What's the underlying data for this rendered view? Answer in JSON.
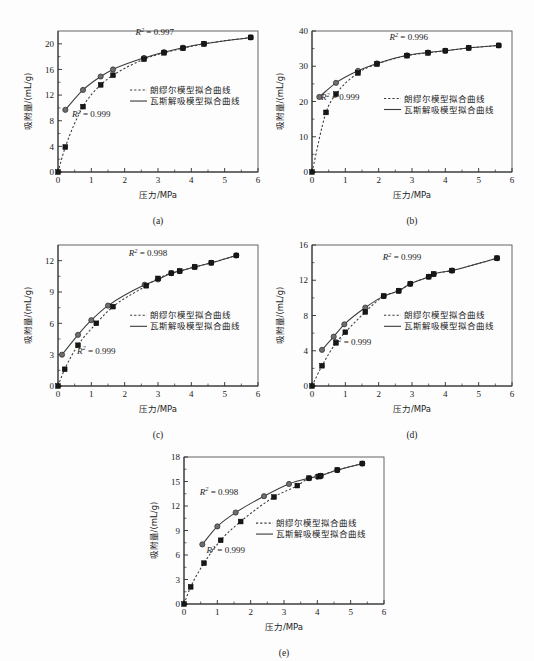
{
  "figure": {
    "background": "#fdfdfd",
    "panel_count": 5,
    "axis_color": "#2b2b2b",
    "curve_color": "#3a3a3a",
    "circle_marker_color": "#6e6e6e",
    "square_marker_color": "#181818"
  },
  "common": {
    "xlabel": "压力/MPa",
    "ylabel": "吸附量/(mL/g)",
    "legend": [
      {
        "label": "朗缪尔模型拟合曲线",
        "style": "dashed"
      },
      {
        "label": "瓦斯解吸模型拟合曲线",
        "style": "solid"
      }
    ],
    "xticks": [
      0,
      1,
      2,
      3,
      4,
      5,
      6
    ],
    "xlim": [
      0,
      6
    ]
  },
  "chart_data": [
    {
      "id": "a",
      "type": "scatter",
      "caption": "(a)",
      "title": "",
      "xlabel": "压力/MPa",
      "ylabel": "吸附量/(mL/g)",
      "xlim": [
        0,
        6
      ],
      "ylim": [
        0,
        22
      ],
      "xticks": [
        0,
        1,
        2,
        3,
        4,
        5,
        6
      ],
      "yticks": [
        0,
        4,
        8,
        12,
        16,
        20
      ],
      "grid": false,
      "legend_position": "center-right",
      "annotations": [
        {
          "text": "R² = 0.997",
          "series": "瓦斯解吸模型拟合曲线",
          "x": 2.9,
          "y": 21.4
        },
        {
          "text": "R² = 0.999",
          "series": "朗缪尔模型拟合曲线",
          "x": 1.0,
          "y": 8.6
        }
      ],
      "series": [
        {
          "name": "瓦斯解吸模型拟合曲线",
          "style": "solid",
          "marker": "circle",
          "x": [
            0.22,
            0.75,
            1.28,
            1.65,
            2.58,
            3.18,
            3.75,
            4.38,
            5.78
          ],
          "y": [
            9.7,
            12.8,
            14.9,
            16.0,
            17.8,
            18.7,
            19.4,
            20.0,
            21.0
          ]
        },
        {
          "name": "朗缪尔模型拟合曲线",
          "style": "dashed",
          "marker": "square",
          "x": [
            0.0,
            0.22,
            0.75,
            1.28,
            1.65,
            2.58,
            3.18,
            3.75,
            4.38,
            5.78
          ],
          "y": [
            0.0,
            3.9,
            10.2,
            13.6,
            15.1,
            17.6,
            18.6,
            19.3,
            20.0,
            21.0
          ]
        }
      ]
    },
    {
      "id": "b",
      "type": "scatter",
      "caption": "(b)",
      "title": "",
      "xlabel": "压力/MPa",
      "ylabel": "吸附量/(mL/g)",
      "xlim": [
        0,
        6
      ],
      "ylim": [
        0,
        40
      ],
      "xticks": [
        0,
        1,
        2,
        3,
        4,
        5,
        6
      ],
      "yticks": [
        0,
        10,
        20,
        30,
        40
      ],
      "grid": false,
      "legend_position": "center-right",
      "annotations": [
        {
          "text": "R² = 0.996",
          "series": "瓦斯解吸模型拟合曲线",
          "x": 2.9,
          "y": 37.4
        },
        {
          "text": "R² = 0.999",
          "series": "朗缪尔模型拟合曲线",
          "x": 0.85,
          "y": 20.5
        }
      ],
      "series": [
        {
          "name": "瓦斯解吸模型拟合曲线",
          "style": "solid",
          "marker": "circle",
          "x": [
            0.22,
            0.72,
            1.38,
            1.95,
            2.85,
            3.48,
            4.0,
            4.7,
            5.6
          ],
          "y": [
            21.3,
            25.3,
            28.7,
            30.8,
            33.1,
            33.9,
            34.4,
            35.2,
            35.9
          ]
        },
        {
          "name": "朗缪尔模型拟合曲线",
          "style": "dashed",
          "marker": "square",
          "x": [
            0.0,
            0.42,
            0.72,
            1.38,
            1.95,
            2.85,
            3.48,
            4.0,
            4.7,
            5.6
          ],
          "y": [
            0.0,
            16.9,
            22.1,
            28.1,
            30.6,
            33.0,
            33.8,
            34.4,
            35.2,
            35.9
          ]
        }
      ]
    },
    {
      "id": "c",
      "type": "scatter",
      "caption": "(c)",
      "title": "",
      "xlabel": "压力/MPa",
      "ylabel": "吸附量/(mL/g)",
      "xlim": [
        0,
        6
      ],
      "ylim": [
        0,
        13.5
      ],
      "xticks": [
        0,
        1,
        2,
        3,
        4,
        5,
        6
      ],
      "yticks": [
        0,
        3,
        6,
        9,
        12
      ],
      "grid": false,
      "legend_position": "center-right",
      "annotations": [
        {
          "text": "R² = 0.998",
          "series": "瓦斯解吸模型拟合曲线",
          "x": 2.7,
          "y": 12.4
        },
        {
          "text": "R² = 0.999",
          "series": "朗缪尔模型拟合曲线",
          "x": 1.15,
          "y": 3.1
        }
      ],
      "series": [
        {
          "name": "瓦斯解吸模型拟合曲线",
          "style": "solid",
          "marker": "circle",
          "x": [
            0.12,
            0.6,
            1.0,
            1.5,
            2.6,
            3.0,
            3.4,
            3.65,
            4.1,
            4.6,
            5.35
          ],
          "y": [
            3.0,
            4.9,
            6.3,
            7.7,
            9.7,
            10.2,
            10.8,
            11.0,
            11.4,
            11.8,
            12.5
          ]
        },
        {
          "name": "朗缪尔模型拟合曲线",
          "style": "dashed",
          "marker": "square",
          "x": [
            0.0,
            0.2,
            0.6,
            1.15,
            1.65,
            2.65,
            3.0,
            3.4,
            3.65,
            4.1,
            4.6,
            5.35
          ],
          "y": [
            0.0,
            1.6,
            3.9,
            6.0,
            7.6,
            9.6,
            10.3,
            10.8,
            11.0,
            11.4,
            11.8,
            12.5
          ]
        }
      ]
    },
    {
      "id": "d",
      "type": "scatter",
      "caption": "(d)",
      "title": "",
      "xlabel": "压力/MPa",
      "ylabel": "吸附量/(mL/g)",
      "xlim": [
        0,
        6
      ],
      "ylim": [
        0,
        16
      ],
      "xticks": [
        0,
        1,
        2,
        3,
        4,
        5,
        6
      ],
      "yticks": [
        0,
        4,
        8,
        12,
        16
      ],
      "grid": false,
      "legend_position": "center-right",
      "annotations": [
        {
          "text": "R² = 0.999",
          "series": "瓦斯解吸模型拟合曲线",
          "x": 2.7,
          "y": 14.3
        },
        {
          "text": "R² = 0.999",
          "series": "朗缪尔模型拟合曲线",
          "x": 1.2,
          "y": 4.6
        }
      ],
      "series": [
        {
          "name": "瓦斯解吸模型拟合曲线",
          "style": "solid",
          "marker": "circle",
          "x": [
            0.3,
            0.65,
            0.97,
            1.6,
            2.15,
            2.6,
            2.95,
            3.5,
            3.65,
            4.2,
            5.55
          ],
          "y": [
            4.1,
            5.6,
            7.0,
            8.9,
            10.2,
            10.8,
            11.6,
            12.4,
            12.7,
            13.1,
            14.5
          ]
        },
        {
          "name": "朗缪尔模型拟合曲线",
          "style": "dashed",
          "marker": "square",
          "x": [
            0.0,
            0.3,
            0.72,
            1.0,
            1.6,
            2.15,
            2.6,
            2.95,
            3.5,
            3.65,
            4.2,
            5.55
          ],
          "y": [
            0.0,
            2.3,
            4.9,
            6.1,
            8.4,
            10.2,
            10.8,
            11.6,
            12.4,
            12.7,
            13.1,
            14.5
          ]
        }
      ]
    },
    {
      "id": "e",
      "type": "scatter",
      "caption": "(e)",
      "title": "",
      "xlabel": "压力/MPa",
      "ylabel": "吸附量/(mL/g)",
      "xlim": [
        0,
        6
      ],
      "ylim": [
        0,
        18
      ],
      "xticks": [
        0,
        1,
        2,
        3,
        4,
        5,
        6
      ],
      "yticks": [
        0,
        3,
        6,
        9,
        12,
        15,
        18
      ],
      "grid": false,
      "legend_position": "center-right",
      "annotations": [
        {
          "text": "R² = 0.998",
          "series": "瓦斯解吸模型拟合曲线",
          "x": 1.05,
          "y": 13.4
        },
        {
          "text": "R² = 0.999",
          "series": "朗缪尔模型拟合曲线",
          "x": 1.25,
          "y": 6.2
        }
      ],
      "series": [
        {
          "name": "瓦斯解吸模型拟合曲线",
          "style": "solid",
          "marker": "circle",
          "x": [
            0.55,
            1.0,
            1.55,
            2.4,
            3.15,
            3.75,
            4.0,
            4.1,
            4.6,
            5.35
          ],
          "y": [
            7.3,
            9.5,
            11.2,
            13.2,
            14.7,
            15.4,
            15.6,
            15.7,
            16.4,
            17.2
          ]
        },
        {
          "name": "朗缪尔模型拟合曲线",
          "style": "dashed",
          "marker": "square",
          "x": [
            0.0,
            0.2,
            0.6,
            1.1,
            1.7,
            2.7,
            3.4,
            3.75,
            4.05,
            4.1,
            4.6,
            5.35
          ],
          "y": [
            0.0,
            2.1,
            5.0,
            7.8,
            10.1,
            13.1,
            14.5,
            15.4,
            15.6,
            15.7,
            16.4,
            17.2
          ]
        }
      ]
    }
  ]
}
